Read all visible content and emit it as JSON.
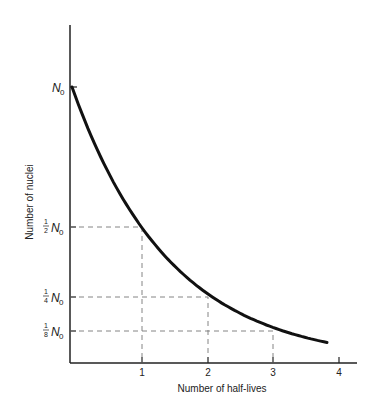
{
  "chart_data": {
    "type": "line",
    "title": "",
    "xlabel": "Number of half-lives",
    "ylabel": "Number of nuclei",
    "x_ticks": [
      "1",
      "2",
      "3",
      "4"
    ],
    "y_ticks": [
      {
        "frac_num": "",
        "frac_den": "",
        "symbol": "N",
        "sub": "0",
        "value": 1
      },
      {
        "frac_num": "1",
        "frac_den": "2",
        "symbol": "N",
        "sub": "0",
        "value": 0.5
      },
      {
        "frac_num": "1",
        "frac_den": "4",
        "symbol": "N",
        "sub": "0",
        "value": 0.25
      },
      {
        "frac_num": "1",
        "frac_den": "8",
        "symbol": "N",
        "sub": "0",
        "value": 0.125
      }
    ],
    "series": [
      {
        "name": "Radioactive decay N(t) = N0 (1/2)^n",
        "x": [
          0,
          1,
          2,
          3,
          3.75
        ],
        "y": [
          1,
          0.5,
          0.25,
          0.125,
          0.074
        ]
      }
    ],
    "guides": [
      {
        "x": 1,
        "y": 0.5
      },
      {
        "x": 2,
        "y": 0.25
      },
      {
        "x": 3,
        "y": 0.125
      }
    ],
    "xlim": [
      0,
      4.3
    ],
    "ylim": [
      0,
      1.2
    ],
    "grid": false,
    "legend": "none"
  }
}
